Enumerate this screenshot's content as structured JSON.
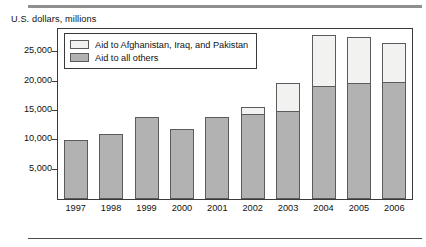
{
  "axis_title": "U.S. dollars, millions",
  "legend": {
    "position": "inside-top-left",
    "entries": [
      {
        "label": "Aid to Afghanistan, Iraq, and Pakistan",
        "swatch_name": "legend-swatch-afpak",
        "color": "#f2f2f0"
      },
      {
        "label": "Aid to all others",
        "swatch_name": "legend-swatch-others",
        "color": "#b2b2b2"
      }
    ]
  },
  "y_axis": {
    "ticks": [
      {
        "label": "25,000",
        "value": 25000
      },
      {
        "label": "20,000",
        "value": 20000
      },
      {
        "label": "15,000",
        "value": 15000
      },
      {
        "label": "10,000",
        "value": 10000
      },
      {
        "label": "5,000",
        "value": 5000
      }
    ]
  },
  "chart_data": {
    "type": "bar",
    "subtype": "stacked-vertical",
    "title": "",
    "subtitle": "",
    "xlabel": "",
    "ylabel": "U.S. dollars, millions",
    "ylim": [
      0,
      29000
    ],
    "grid": false,
    "legend_position": "inside-top-left",
    "categories": [
      "1997",
      "1998",
      "1999",
      "2000",
      "2001",
      "2002",
      "2003",
      "2004",
      "2005",
      "2006"
    ],
    "series": [
      {
        "name": "Aid to all others",
        "color": "#b2b2b2",
        "values": [
          10000,
          11100,
          14000,
          11900,
          14000,
          14500,
          15000,
          19300,
          19800,
          20000
        ]
      },
      {
        "name": "Aid to Afghanistan, Iraq, and Pakistan",
        "color": "#f2f2f0",
        "values": [
          0,
          0,
          0,
          0,
          0,
          1200,
          4800,
          8700,
          7800,
          6600
        ]
      }
    ],
    "totals": [
      10000,
      11100,
      14000,
      11900,
      14000,
      15700,
      19800,
      28000,
      27600,
      26600
    ]
  }
}
